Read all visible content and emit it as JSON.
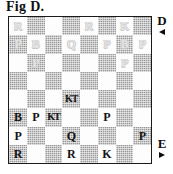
{
  "figure": {
    "caption": "Fig D."
  },
  "board": {
    "rows": 8,
    "columns": 8,
    "light_square_color": "#fdfdfd",
    "dark_square_color": "#9a9a9a",
    "white_piece_color": "#e2e2e2",
    "black_piece_color": "#141414",
    "border_color": "#1a1a1a",
    "squares": [
      [
        {
          "piece": "R",
          "side": "white"
        },
        {
          "piece": "",
          "side": ""
        },
        {
          "piece": "",
          "side": ""
        },
        {
          "piece": "",
          "side": ""
        },
        {
          "piece": "R",
          "side": "white"
        },
        {
          "piece": "",
          "side": ""
        },
        {
          "piece": "K",
          "side": "white"
        },
        {
          "piece": "",
          "side": ""
        }
      ],
      [
        {
          "piece": "P",
          "side": "white"
        },
        {
          "piece": "B",
          "side": "white"
        },
        {
          "piece": "",
          "side": ""
        },
        {
          "piece": "Q",
          "side": "white"
        },
        {
          "piece": "",
          "side": ""
        },
        {
          "piece": "P",
          "side": "white"
        },
        {
          "piece": "B",
          "side": "white"
        },
        {
          "piece": "P",
          "side": "white"
        }
      ],
      [
        {
          "piece": "",
          "side": ""
        },
        {
          "piece": "P",
          "side": "white"
        },
        {
          "piece": "",
          "side": ""
        },
        {
          "piece": "",
          "side": ""
        },
        {
          "piece": "",
          "side": ""
        },
        {
          "piece": "",
          "side": ""
        },
        {
          "piece": "P",
          "side": "white"
        },
        {
          "piece": "",
          "side": ""
        }
      ],
      [
        {
          "piece": "",
          "side": ""
        },
        {
          "piece": "",
          "side": ""
        },
        {
          "piece": "",
          "side": ""
        },
        {
          "piece": "",
          "side": ""
        },
        {
          "piece": "",
          "side": ""
        },
        {
          "piece": "",
          "side": ""
        },
        {
          "piece": "",
          "side": ""
        },
        {
          "piece": "",
          "side": ""
        }
      ],
      [
        {
          "piece": "",
          "side": ""
        },
        {
          "piece": "",
          "side": ""
        },
        {
          "piece": "",
          "side": ""
        },
        {
          "piece": "KT",
          "side": "black"
        },
        {
          "piece": "",
          "side": ""
        },
        {
          "piece": "",
          "side": ""
        },
        {
          "piece": "",
          "side": ""
        },
        {
          "piece": "",
          "side": ""
        }
      ],
      [
        {
          "piece": "B",
          "side": "black"
        },
        {
          "piece": "P",
          "side": "black"
        },
        {
          "piece": "KT",
          "side": "black"
        },
        {
          "piece": "",
          "side": ""
        },
        {
          "piece": "",
          "side": ""
        },
        {
          "piece": "P",
          "side": "black"
        },
        {
          "piece": "",
          "side": ""
        },
        {
          "piece": "",
          "side": ""
        }
      ],
      [
        {
          "piece": "P",
          "side": "black"
        },
        {
          "piece": "",
          "side": ""
        },
        {
          "piece": "",
          "side": ""
        },
        {
          "piece": "Q",
          "side": "black"
        },
        {
          "piece": "",
          "side": ""
        },
        {
          "piece": "",
          "side": ""
        },
        {
          "piece": "",
          "side": ""
        },
        {
          "piece": "P",
          "side": "black"
        }
      ],
      [
        {
          "piece": "R",
          "side": "black"
        },
        {
          "piece": "",
          "side": ""
        },
        {
          "piece": "",
          "side": ""
        },
        {
          "piece": "R",
          "side": "black"
        },
        {
          "piece": "",
          "side": ""
        },
        {
          "piece": "K",
          "side": "black"
        },
        {
          "piece": "",
          "side": ""
        },
        {
          "piece": "",
          "side": ""
        }
      ]
    ]
  },
  "markers": {
    "top": {
      "label": "D",
      "arrow": "triangle-left-icon"
    },
    "bottom": {
      "label": "E",
      "arrow": "triangle-right-icon"
    }
  }
}
